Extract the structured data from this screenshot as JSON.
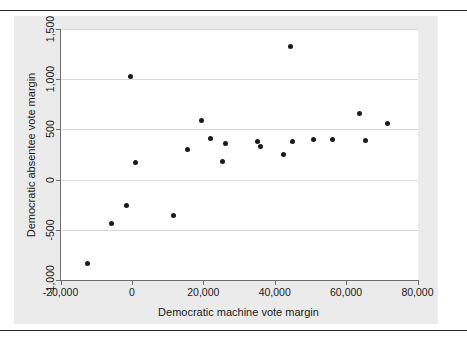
{
  "chart_data": {
    "type": "scatter",
    "title": "",
    "xlabel": "Democratic machine vote margin",
    "ylabel": "Democratic absentee vote margin",
    "xlim": [
      -20000,
      80000
    ],
    "ylim": [
      -1000,
      1500
    ],
    "xticks": [
      -20000,
      0,
      20000,
      40000,
      60000,
      80000
    ],
    "xticklabels": [
      "-20,000",
      "0",
      "20,000",
      "40,000",
      "60,000",
      "80,000"
    ],
    "yticks": [
      -1000,
      -500,
      0,
      500,
      1000,
      1500
    ],
    "yticklabels": [
      "-1,000",
      "-500",
      "0",
      "500",
      "1,000",
      "1,500"
    ],
    "grid": "horizontal",
    "legend": "none",
    "marker": "filled-circle",
    "marker_color": "#1a1a1a",
    "points": [
      {
        "x": -12300,
        "y": -840
      },
      {
        "x": -5600,
        "y": -440
      },
      {
        "x": -1400,
        "y": -260
      },
      {
        "x": -400,
        "y": 1025
      },
      {
        "x": 1100,
        "y": 175
      },
      {
        "x": 11600,
        "y": -355
      },
      {
        "x": 15700,
        "y": 300
      },
      {
        "x": 19600,
        "y": 585
      },
      {
        "x": 21900,
        "y": 410
      },
      {
        "x": 25300,
        "y": 185
      },
      {
        "x": 26100,
        "y": 360
      },
      {
        "x": 35300,
        "y": 380
      },
      {
        "x": 36100,
        "y": 325
      },
      {
        "x": 42400,
        "y": 250
      },
      {
        "x": 44500,
        "y": 1330
      },
      {
        "x": 45100,
        "y": 375
      },
      {
        "x": 51000,
        "y": 395
      },
      {
        "x": 56100,
        "y": 395
      },
      {
        "x": 63700,
        "y": 660
      },
      {
        "x": 65400,
        "y": 385
      },
      {
        "x": 71600,
        "y": 560
      }
    ]
  },
  "figure": {
    "background": "#ffffff",
    "plot_background": "#ffffff",
    "region_background": "#ebebeb",
    "grid_color": "#d9d9d9",
    "axis_color": "#6e6e6e",
    "rule_color": "#2b2b2b"
  }
}
